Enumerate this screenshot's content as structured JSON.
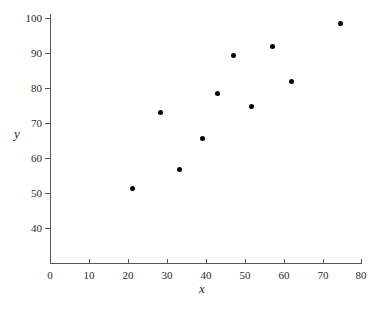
{
  "chart_data": {
    "type": "scatter",
    "title": "",
    "xlabel": "x",
    "ylabel": "y",
    "xlim": [
      0,
      80
    ],
    "ylim": [
      35,
      102
    ],
    "xticks": [
      0,
      10,
      20,
      30,
      40,
      50,
      60,
      70,
      80
    ],
    "yticks": [
      40,
      50,
      60,
      70,
      80,
      90,
      100
    ],
    "grid": false,
    "legend": null,
    "marker": {
      "shape": "filled-circle",
      "color": "#000000",
      "size_px": 5
    },
    "series": [
      {
        "name": "observations",
        "points": [
          {
            "x": 21.3,
            "y": 51.4
          },
          {
            "x": 28.5,
            "y": 72.9
          },
          {
            "x": 33.4,
            "y": 56.6
          },
          {
            "x": 39.3,
            "y": 65.7
          },
          {
            "x": 43.2,
            "y": 78.5
          },
          {
            "x": 47.3,
            "y": 89.4
          },
          {
            "x": 51.9,
            "y": 74.6
          },
          {
            "x": 57.3,
            "y": 92.0
          },
          {
            "x": 62.0,
            "y": 82.0
          },
          {
            "x": 74.6,
            "y": 98.3
          }
        ]
      }
    ]
  },
  "caption": ""
}
